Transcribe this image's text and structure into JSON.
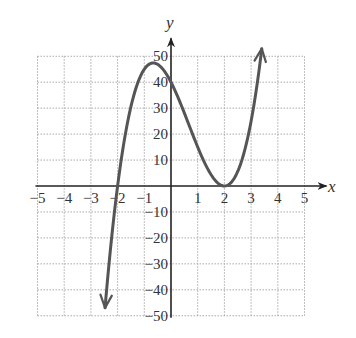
{
  "chart_data": {
    "type": "line",
    "title": "",
    "xlabel": "x",
    "ylabel": "y",
    "xlim": [
      -5,
      5
    ],
    "ylim": [
      -50,
      50
    ],
    "grid": true,
    "grid_style": "dotted",
    "x_ticks": [
      -5,
      -4,
      -3,
      -2,
      -1,
      1,
      2,
      3,
      4,
      5
    ],
    "x_tick_labels": [
      "−5",
      "−4",
      "−3",
      "−2",
      "−1",
      "1",
      "2",
      "3",
      "4",
      "5"
    ],
    "y_ticks": [
      50,
      40,
      30,
      20,
      10,
      -10,
      -20,
      -30,
      -40,
      -50
    ],
    "y_tick_labels": [
      "50",
      "40",
      "30",
      "20",
      "10",
      "−10",
      "−20",
      "−30",
      "−40",
      "−50"
    ],
    "series": [
      {
        "name": "f(x) = 5(x+2)(x-2)^2",
        "color": "#555555",
        "arrows_at_ends": true,
        "x": [
          -2.47,
          -2.25,
          -2.0,
          -1.75,
          -1.5,
          -1.25,
          -1.0,
          -0.67,
          -0.5,
          -0.25,
          0.0,
          0.25,
          0.5,
          0.75,
          1.0,
          1.25,
          1.5,
          1.75,
          2.0,
          2.25,
          2.5,
          2.75,
          3.0,
          3.25,
          3.4
        ],
        "values": [
          -47.0,
          -24.3,
          0.0,
          16.4,
          30.6,
          37.8,
          45.0,
          47.4,
          46.9,
          44.8,
          40.0,
          28.4,
          28.1,
          21.5,
          15.0,
          9.1,
          4.4,
          1.2,
          0.0,
          1.3,
          5.6,
          13.0,
          25.0,
          39.1,
          52.9
        ]
      }
    ],
    "features": {
      "x_intercepts": [
        -2,
        2
      ],
      "y_intercept": 40,
      "local_max": [
        -0.67,
        47.4
      ],
      "local_min": [
        2,
        0
      ]
    }
  },
  "labels": {
    "x_axis": "x",
    "y_axis": "y"
  },
  "colors": {
    "curve": "#555555",
    "axis": "#222222",
    "grid": "#aaaaaa"
  }
}
